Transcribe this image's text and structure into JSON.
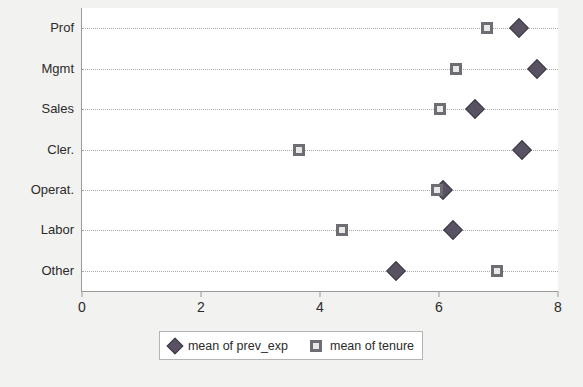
{
  "chart_data": {
    "type": "scatter",
    "title": "",
    "subtitle": "",
    "xlabel": "",
    "ylabel": "",
    "orientation": "horizontal",
    "categories": [
      "Prof",
      "Mgmt",
      "Sales",
      "Cler.",
      "Operat.",
      "Labor",
      "Other"
    ],
    "xlim": [
      0,
      8
    ],
    "xticks": [
      0,
      2,
      4,
      6,
      8
    ],
    "xtick_labels": [
      "0",
      "2",
      "4",
      "6",
      "8"
    ],
    "grid": "horizontal-dotted",
    "legend_position": "below-plot",
    "series": [
      {
        "name": "mean of prev_exp",
        "marker": "diamond",
        "color": "#595262",
        "values": [
          7.34,
          7.65,
          6.61,
          7.39,
          6.07,
          6.23,
          5.27
        ]
      },
      {
        "name": "mean of tenure",
        "marker": "square",
        "color": "#6d6d73",
        "values": [
          6.8,
          6.28,
          6.02,
          3.65,
          5.96,
          4.37,
          6.97
        ]
      }
    ]
  },
  "legend": {
    "entries": [
      {
        "label": "mean of prev_exp",
        "marker": "diamond"
      },
      {
        "label": "mean of tenure",
        "marker": "square"
      }
    ]
  },
  "colors": {
    "page_background": "#f2f2f0",
    "plot_background": "#ffffff",
    "axis": "#9a9a9a",
    "grid": "#a8a8a8",
    "diamond": "#595262",
    "square_border": "#6d6d73",
    "square_fill": "#e8e8e6",
    "text": "#2b2b2b"
  }
}
